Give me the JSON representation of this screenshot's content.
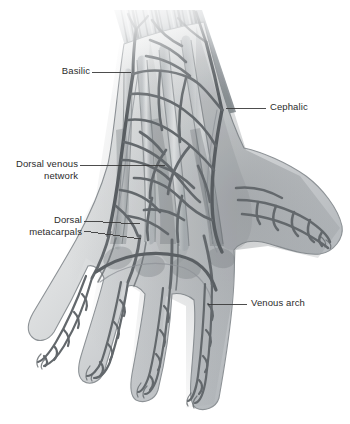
{
  "figure": {
    "background_color": "#ffffff",
    "style": "grayscale medical illustration",
    "view": "dorsal (posterior) view of right hand with forearm"
  },
  "palette": {
    "label_text": "#2b2b2b",
    "leader_line": "#3a3a3a",
    "vein_outline": "#6b7074",
    "vein_dark": "#55595d",
    "skin_light": "#e8e9ea",
    "skin_mid": "#c9cbcd",
    "skin_shadow": "#9aa0a4",
    "tendon_shade": "#8e9498",
    "forearm_dark": "#5c6165"
  },
  "labels": [
    {
      "id": "basilic",
      "name": "Basilic",
      "text": "Basilic",
      "align": "right",
      "text_x": 38,
      "text_y": 65,
      "text_width": 52,
      "leader": {
        "x1": 92,
        "y1": 72,
        "x2": 131,
        "y2": 72
      }
    },
    {
      "id": "cephalic",
      "name": "Cephalic",
      "text": "Cephalic",
      "align": "left",
      "text_x": 270,
      "text_y": 101,
      "text_width": 70,
      "leader": {
        "x1": 226,
        "y1": 108,
        "x2": 266,
        "y2": 108
      }
    },
    {
      "id": "dorsal-venous-network",
      "name": "Dorsal venous network",
      "text": "Dorsal venous\nnetwork",
      "align": "right",
      "text_x": 4,
      "text_y": 158,
      "text_width": 74,
      "leader": {
        "x1": 80,
        "y1": 165,
        "x2": 165,
        "y2": 165
      }
    },
    {
      "id": "dorsal-metacarpals",
      "name": "Dorsal metacarpals",
      "text": "Dorsal\nmetacarpals",
      "align": "right",
      "text_x": 8,
      "text_y": 214,
      "text_width": 74,
      "leader": {
        "x1": 84,
        "y1": 221,
        "x2": 140,
        "y2": 224
      },
      "leader2": {
        "x1": 84,
        "y1": 231,
        "x2": 141,
        "y2": 239
      }
    },
    {
      "id": "venous-arch",
      "name": "Venous arch",
      "text": "Venous arch",
      "align": "left",
      "text_x": 251,
      "text_y": 297,
      "text_width": 90,
      "leader": {
        "x1": 208,
        "y1": 304,
        "x2": 247,
        "y2": 304
      }
    }
  ],
  "anatomy": {
    "structures": [
      "forearm (faded proximal cut edge)",
      "wrist",
      "dorsum of hand",
      "thumb",
      "index finger",
      "middle finger",
      "ring finger",
      "little finger",
      "basilic vein",
      "cephalic vein",
      "dorsal venous network",
      "dorsal metacarpal veins",
      "dorsal venous arch",
      "extensor tendons"
    ]
  }
}
